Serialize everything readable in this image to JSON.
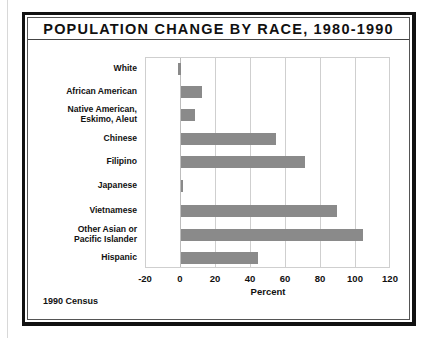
{
  "chart_data": {
    "type": "bar",
    "orientation": "horizontal",
    "title": "POPULATION CHANGE BY RACE, 1980-1990",
    "xlabel": "Percent",
    "ylabel": "",
    "categories": [
      "White",
      "African American",
      "Native American, Eskimo, Aleut",
      "Chinese",
      "Filipino",
      "Japanese",
      "Vietnamese",
      "Other Asian or Pacific Islander",
      "Hispanic"
    ],
    "category_lines": [
      [
        "White"
      ],
      [
        "African American"
      ],
      [
        "Native American,",
        "Eskimo, Aleut"
      ],
      [
        "Chinese"
      ],
      [
        "Filipino"
      ],
      [
        "Japanese"
      ],
      [
        "Vietnamese"
      ],
      [
        "Other Asian or",
        "Pacific Islander"
      ],
      [
        "Hispanic"
      ]
    ],
    "values": [
      -2,
      12,
      8,
      54,
      71,
      1,
      89,
      104,
      44
    ],
    "xlim": [
      -20,
      120
    ],
    "xticks": [
      "-20",
      "0",
      "20",
      "40",
      "60",
      "80",
      "100",
      "120"
    ],
    "grid": true,
    "legend": "none",
    "bar_color": "#8a8a8a",
    "source_note": "1990 Census"
  }
}
